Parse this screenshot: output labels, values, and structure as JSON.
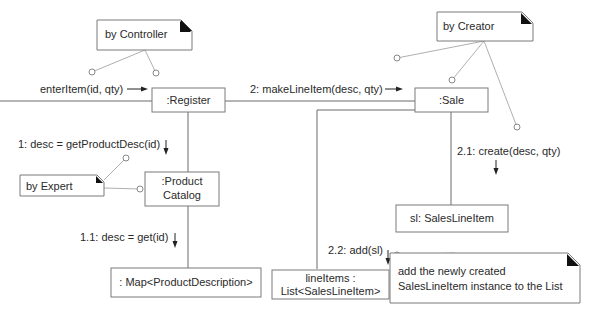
{
  "diagram": {
    "type": "UML communication diagram",
    "objects": {
      "register": ":Register",
      "sale": ":Sale",
      "product_catalog_line1": ":Product",
      "product_catalog_line2": "Catalog",
      "map": ": Map<ProductDescription>",
      "line_items_line1": "lineItems :",
      "line_items_line2": "List<SalesLineItem>",
      "sales_line_item": "sl: SalesLineItem"
    },
    "messages": {
      "enter_item": "enterItem(id, qty)",
      "make_line_item": "2: makeLineItem(desc, qty)",
      "get_product_desc": "1: desc = getProductDesc(id)",
      "get": "1.1: desc = get(id)",
      "create": "2.1: create(desc, qty)",
      "add": "2.2: add(sl)"
    },
    "notes": {
      "by_controller": "by Controller",
      "by_creator": "by Creator",
      "by_expert": "by Expert",
      "add_note_line1": "add the newly created",
      "add_note_line2": "SalesLineItem instance to the List"
    },
    "colors": {
      "line": "#6a6a6a",
      "note_fold": "#111111",
      "text": "#2a2a2a",
      "background": "#ffffff"
    }
  }
}
